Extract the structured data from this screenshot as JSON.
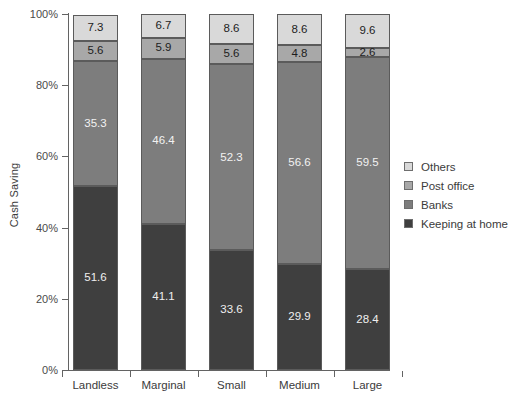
{
  "chart_data": {
    "type": "bar",
    "subtype": "stacked-percentage",
    "title": "",
    "xlabel": "",
    "ylabel": "Cash Saving",
    "ylim": [
      0,
      100
    ],
    "ytick_labels": [
      "0%",
      "20%",
      "40%",
      "60%",
      "80%",
      "100%"
    ],
    "ytick_values": [
      0,
      20,
      40,
      60,
      80,
      100
    ],
    "grid": false,
    "legend_position": "right",
    "categories": [
      "Landless",
      "Marginal",
      "Small",
      "Medium",
      "Large"
    ],
    "series": [
      {
        "name": "Keeping at home",
        "color": "#3f3f3f",
        "values": [
          51.6,
          41.1,
          33.6,
          29.9,
          28.4
        ]
      },
      {
        "name": "Banks",
        "color": "#7d7d7d",
        "values": [
          35.3,
          46.4,
          52.3,
          56.6,
          59.5
        ]
      },
      {
        "name": "Post office",
        "color": "#a8a8a8",
        "values": [
          5.6,
          5.9,
          5.6,
          4.8,
          2.6
        ]
      },
      {
        "name": "Others",
        "color": "#d9d9d9",
        "values": [
          7.3,
          6.7,
          8.6,
          8.6,
          9.6
        ]
      }
    ]
  },
  "legend": {
    "items": [
      {
        "label": "Others",
        "color": "#d9d9d9"
      },
      {
        "label": "Post office",
        "color": "#a8a8a8"
      },
      {
        "label": "Banks",
        "color": "#7d7d7d"
      },
      {
        "label": "Keeping at home",
        "color": "#3f3f3f"
      }
    ]
  },
  "axis": {
    "y_title": "Cash Saving"
  }
}
